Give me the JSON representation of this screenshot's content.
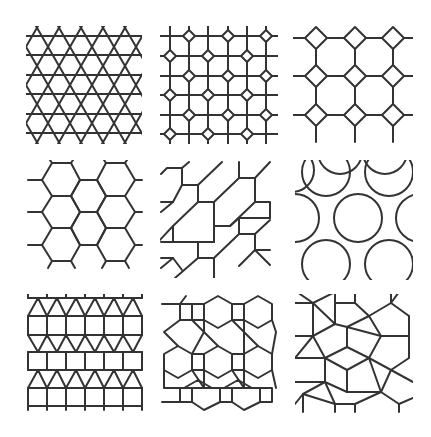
{
  "figure": {
    "layout": "3x3 grid of tiling patterns",
    "stroke_color": "#333333",
    "background": "#ffffff",
    "tiles": [
      {
        "id": 1,
        "name": "trihexagonal-kagome",
        "description": "Triangles and hexagons (star lattice of crossing lines)"
      },
      {
        "id": 2,
        "name": "square-grid-with-diamonds",
        "description": "Square grid with small diamonds at alternating intersections"
      },
      {
        "id": 3,
        "name": "truncated-square",
        "description": "Octagons and squares (4.8.8)"
      },
      {
        "id": 4,
        "name": "hexagonal",
        "description": "Regular hexagons (6.6.6)"
      },
      {
        "id": 5,
        "name": "skewed-hexagonal",
        "description": "Sheared hexagons"
      },
      {
        "id": 6,
        "name": "circles-triangles",
        "description": "Circles packed with curved triangles"
      },
      {
        "id": 7,
        "name": "elongated-triangular",
        "description": "Rows of squares and triangles (3.3.3.4.4)"
      },
      {
        "id": 8,
        "name": "rhombitrihexagonal",
        "description": "Hexagons, squares and triangles (3.4.6.4)"
      },
      {
        "id": 9,
        "name": "snub-square",
        "description": "Squares and triangles (3.3.4.3.4)"
      }
    ]
  }
}
